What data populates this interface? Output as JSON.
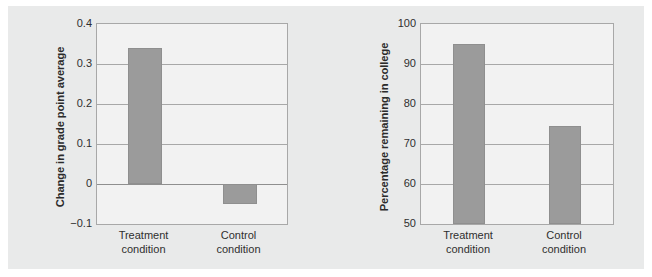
{
  "figure": {
    "background_color": "#ffffff",
    "panel_color": "#e9eaea",
    "plot_background_color": "#f2f2f2",
    "bar_color": "#9b9b9b",
    "axis_color": "#a8a8a8"
  },
  "chart_data": [
    {
      "type": "bar",
      "title": "",
      "xlabel": "",
      "ylabel": "Change in grade point average",
      "categories": [
        "Treatment\ncondition",
        "Control\ncondition"
      ],
      "values": [
        0.34,
        -0.05
      ],
      "ylim": [
        -0.1,
        0.4
      ],
      "yticks": [
        0.4,
        0.3,
        0.2,
        0.1,
        0,
        -0.1
      ],
      "ytick_labels": [
        "0.4",
        "0.3",
        "0.2",
        "0.1",
        "0",
        "−0.1"
      ],
      "grid": true,
      "legend": "none",
      "baseline": 0
    },
    {
      "type": "bar",
      "title": "",
      "xlabel": "",
      "ylabel": "Percentage remaining in college",
      "categories": [
        "Treatment\ncondition",
        "Control\ncondition"
      ],
      "values": [
        95,
        74.5
      ],
      "ylim": [
        50,
        100
      ],
      "yticks": [
        100,
        90,
        80,
        70,
        60,
        50
      ],
      "ytick_labels": [
        "100",
        "90",
        "80",
        "70",
        "60",
        "50"
      ],
      "grid": true,
      "legend": "none",
      "baseline": 50
    }
  ]
}
